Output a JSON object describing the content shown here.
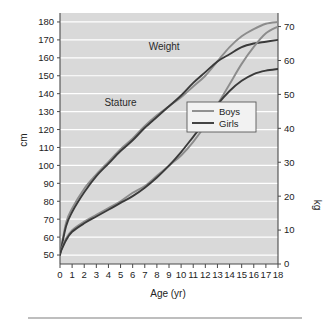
{
  "chart_data": {
    "type": "line",
    "title": "",
    "xlabel": "Age (yr)",
    "ylabel": "cm",
    "y2label": "kg",
    "xlim": [
      0,
      18
    ],
    "ylim": [
      45,
      185
    ],
    "y2lim": [
      0,
      74
    ],
    "grid": true,
    "legend_position": "center-right",
    "x_ticks": [
      "0",
      "1",
      "2",
      "3",
      "4",
      "5",
      "6",
      "7",
      "8",
      "9",
      "10",
      "11",
      "12",
      "13",
      "14",
      "15",
      "16",
      "17",
      "18"
    ],
    "y_ticks": [
      "50",
      "60",
      "70",
      "80",
      "90",
      "100",
      "110",
      "120",
      "130",
      "140",
      "150",
      "160",
      "170",
      "180"
    ],
    "y2_ticks": [
      "0",
      "10",
      "20",
      "30",
      "40",
      "50",
      "60",
      "70"
    ],
    "annotations": [
      {
        "text": "Stature",
        "x": 5.0,
        "y": 133
      },
      {
        "text": "Weight",
        "x": 8.6,
        "y": 63
      }
    ],
    "legend": [
      {
        "name": "Boys",
        "color": "#8c8c8c"
      },
      {
        "name": "Girls",
        "color": "#3a3a3a"
      }
    ],
    "x": [
      0,
      0.5,
      1,
      2,
      3,
      4,
      5,
      6,
      7,
      8,
      9,
      10,
      11,
      12,
      13,
      14,
      15,
      16,
      17,
      18
    ],
    "series": [
      {
        "name": "Boys",
        "axis": "left",
        "measure": "stature",
        "unit": "cm",
        "color": "#8c8c8c",
        "values": [
          50,
          68,
          76,
          87,
          95,
          102,
          109,
          115,
          122,
          128,
          133,
          138,
          144,
          150,
          158,
          166,
          172,
          176,
          179,
          180
        ]
      },
      {
        "name": "Girls",
        "axis": "left",
        "measure": "stature",
        "unit": "cm",
        "color": "#3a3a3a",
        "values": [
          50,
          66,
          74,
          85,
          94,
          101,
          108,
          114,
          121,
          127,
          133,
          139,
          146,
          152,
          158,
          162,
          166,
          168,
          169,
          170
        ]
      },
      {
        "name": "Boys",
        "axis": "right",
        "measure": "weight",
        "unit": "kg",
        "color": "#8c8c8c",
        "values": [
          3.3,
          7.5,
          10,
          12.5,
          14.5,
          16.5,
          18.5,
          21,
          23,
          26,
          29,
          32,
          36,
          41,
          47,
          53,
          59,
          64,
          68,
          70
        ]
      },
      {
        "name": "Girls",
        "axis": "right",
        "measure": "weight",
        "unit": "kg",
        "color": "#3a3a3a",
        "values": [
          3.2,
          7.0,
          9.5,
          12,
          14,
          16,
          18,
          20,
          22.5,
          25.5,
          29,
          33,
          37.5,
          42,
          47,
          51,
          54,
          56,
          57,
          57.5
        ]
      }
    ],
    "colors": {
      "plot_background": "#d9d9d9",
      "gridline": "#ffffff",
      "axis": "#4a4a4a",
      "boys": "#8c8c8c",
      "girls": "#3a3a3a",
      "page_background": "#ffffff",
      "rule": "#a9a9a9"
    }
  }
}
